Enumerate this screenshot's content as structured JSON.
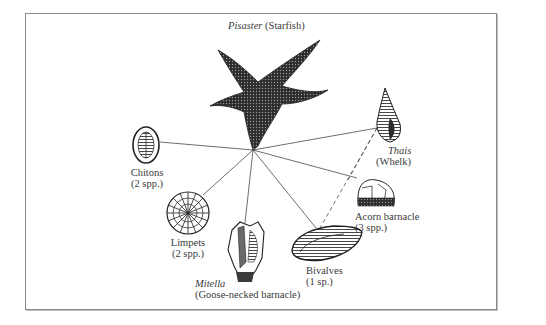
{
  "diagram": {
    "type": "food-web",
    "predator": {
      "genus": "Pisaster",
      "common": "(Starfish)"
    },
    "prey": [
      {
        "id": "chitons",
        "line1": "Chitons",
        "line2": "(2 spp.)"
      },
      {
        "id": "limpets",
        "line1": "Limpets",
        "line2": "(2 spp.)"
      },
      {
        "id": "mitella",
        "genus": "Mitella",
        "line2": "(Goose-necked barnacle)"
      },
      {
        "id": "bivalves",
        "line1": "Bivalves",
        "line2": "(1 sp.)"
      },
      {
        "id": "acorn",
        "line1": "Acorn barnacle",
        "line2": "(3 spp.)"
      },
      {
        "id": "thais",
        "genus": "Thais",
        "line2": "(Whelk)"
      }
    ],
    "links": {
      "solid_from_hub": [
        "chitons",
        "limpets",
        "mitella",
        "bivalves",
        "acorn",
        "thais"
      ],
      "dashed_from_thais": [
        "bivalves",
        "acorn"
      ]
    },
    "colors": {
      "line": "#4a4a4a",
      "text": "#3a3a3a",
      "border": "#8a8a8a"
    }
  }
}
